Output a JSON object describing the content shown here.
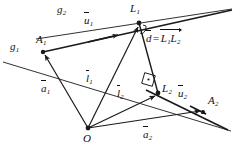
{
  "figure": {
    "type": "geometry-diagram",
    "background_color": "#ffffff",
    "stroke_color": "#1a1a1a",
    "width": 234,
    "height": 155
  },
  "points": [
    {
      "id": "A1",
      "label": "A",
      "sub": "1",
      "x": 43,
      "y": 52,
      "label_x": 36,
      "label_y": 34
    },
    {
      "id": "L1",
      "label": "L",
      "sub": "1",
      "x": 139,
      "y": 23,
      "label_x": 131,
      "label_y": 4
    },
    {
      "id": "L2",
      "label": "L",
      "sub": "2",
      "x": 158,
      "y": 93,
      "label_x": 162,
      "label_y": 84
    },
    {
      "id": "A2",
      "label": "A",
      "sub": "2",
      "x": 203,
      "y": 112,
      "label_x": 208,
      "label_y": 96
    },
    {
      "id": "O",
      "label": "O",
      "sub": "",
      "x": 88,
      "y": 128,
      "label_x": 83,
      "label_y": 133
    }
  ],
  "lines": [
    {
      "id": "g1",
      "label": "g",
      "sub": "1",
      "label_x": 10,
      "label_y": 41,
      "x1": 3,
      "y1": 62,
      "x2": 228,
      "y2": 130
    },
    {
      "id": "g2",
      "label": "g",
      "sub": "2",
      "label_x": 57,
      "label_y": 4,
      "x1": 38,
      "y1": 38,
      "x2": 231,
      "y2": 9
    }
  ],
  "vectors": [
    {
      "id": "u1",
      "label": "u",
      "sub": "1",
      "kind": "unit-direction",
      "label_x": 84,
      "label_y": 16
    },
    {
      "id": "u2",
      "label": "u",
      "sub": "2",
      "kind": "unit-direction",
      "label_x": 178,
      "label_y": 89
    },
    {
      "id": "a1",
      "label": "a",
      "sub": "1",
      "kind": "position",
      "label_x": 42,
      "label_y": 84
    },
    {
      "id": "a2",
      "label": "a",
      "sub": "2",
      "kind": "position",
      "label_x": 143,
      "label_y": 130
    },
    {
      "id": "l1",
      "label": "l",
      "sub": "1",
      "kind": "foot-vector",
      "label_x": 86,
      "label_y": 74
    },
    {
      "id": "l2",
      "label": "l",
      "sub": "2",
      "kind": "foot-vector",
      "label_x": 117,
      "label_y": 89
    }
  ],
  "equation": {
    "id": "distance-equation",
    "x": 146,
    "y": 33,
    "lhs": "d",
    "eq": "=",
    "rhs_first": "L",
    "rhs_first_sub": "1",
    "rhs_second": "L",
    "rhs_second_sub": "2"
  },
  "angle_marks": [
    {
      "id": "right-angle-L1",
      "at": "L1"
    },
    {
      "id": "right-angle-L2",
      "at": "L2"
    }
  ]
}
